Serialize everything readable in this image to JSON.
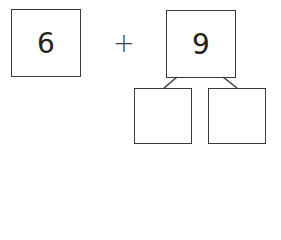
{
  "equation": {
    "addend_1": "6",
    "operator": "+",
    "addend_2": "9",
    "split_boxes": [
      "",
      ""
    ]
  }
}
